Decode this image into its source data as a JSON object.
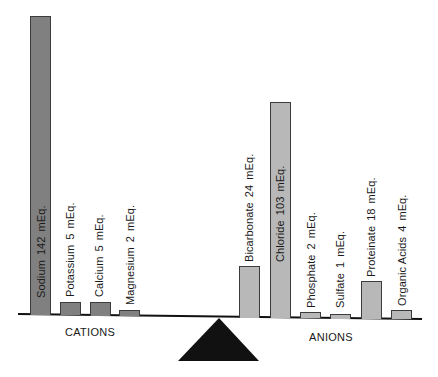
{
  "chart_data": {
    "type": "bar",
    "title": "",
    "subtitle": "",
    "xlabel": "",
    "ylabel": "",
    "grid": false,
    "legend": "none",
    "layout": "balance-scale: bars rest on a beam over a triangular fulcrum; cations on left, anions on right",
    "groups": [
      {
        "name": "CATIONS",
        "color": "#808080",
        "categories": [
          "Sodium",
          "Potassium",
          "Calcium",
          "Magnesium"
        ],
        "values": [
          142,
          5,
          5,
          2
        ],
        "unit": "mEq.",
        "labels": [
          "Sodium 142 mEq.",
          "Potassium 5 mEq.",
          "Calcium 5 mEq.",
          "Magnesium 2 mEq."
        ]
      },
      {
        "name": "ANIONS",
        "color": "#b8b8b8",
        "categories": [
          "Bicarbonate",
          "Chloride",
          "Phosphate",
          "Sulfate",
          "Proteinate",
          "Organic Acids"
        ],
        "values": [
          24,
          103,
          2,
          1,
          18,
          4
        ],
        "unit": "mEq.",
        "labels": [
          "Bicarbonate 24 mEq.",
          "Chloride 103 mEq.",
          "Phosphate 2 mEq.",
          "Sulfate 1 mEq.",
          "Proteinate 18 mEq.",
          "Organic Acids 4 mEq."
        ]
      }
    ],
    "totals": {
      "CATIONS": 154,
      "ANIONS": 152
    }
  },
  "labels": {
    "cations": "CATIONS",
    "anions": "ANIONS"
  },
  "colors": {
    "cation_bar": "#808080",
    "anion_bar": "#b8b8b8",
    "beam": "#111111",
    "fulcrum": "#111111"
  },
  "bars": [
    {
      "id": "sodium",
      "group": "cation",
      "name": "Sodium",
      "value": "142",
      "unit": "mEq.",
      "x": 30,
      "w": 21,
      "top": 16,
      "base": 315,
      "labelX": 35,
      "labelBottom": 298
    },
    {
      "id": "potassium",
      "group": "cation",
      "name": "Potassium",
      "value": "5",
      "unit": "mEq.",
      "x": 60,
      "w": 21,
      "top": 302,
      "base": 315,
      "labelX": 64,
      "labelBottom": 297
    },
    {
      "id": "calcium",
      "group": "cation",
      "name": "Calcium",
      "value": "5",
      "unit": "mEq.",
      "x": 90,
      "w": 21,
      "top": 302,
      "base": 316,
      "labelX": 93,
      "labelBottom": 297
    },
    {
      "id": "magnesium",
      "group": "cation",
      "name": "Magnesium",
      "value": "2",
      "unit": "mEq.",
      "x": 119,
      "w": 21,
      "top": 310,
      "base": 316,
      "labelX": 124,
      "labelBottom": 305
    },
    {
      "id": "bicarbonate",
      "group": "anion",
      "name": "Bicarbonate",
      "value": "24",
      "unit": "mEq.",
      "x": 239,
      "w": 21,
      "top": 266,
      "base": 318,
      "labelX": 243,
      "labelBottom": 262
    },
    {
      "id": "chloride",
      "group": "anion",
      "name": "Chloride",
      "value": "103",
      "unit": "mEq.",
      "x": 270,
      "w": 21,
      "top": 102,
      "base": 318,
      "labelX": 274,
      "labelBottom": 262
    },
    {
      "id": "phosphate",
      "group": "anion",
      "name": "Phosphate",
      "value": "2",
      "unit": "mEq.",
      "x": 300,
      "w": 21,
      "top": 312,
      "base": 318,
      "labelX": 305,
      "labelBottom": 308
    },
    {
      "id": "sulfate",
      "group": "anion",
      "name": "Sulfate",
      "value": "1",
      "unit": "mEq.",
      "x": 330,
      "w": 21,
      "top": 314,
      "base": 319,
      "labelX": 334,
      "labelBottom": 308
    },
    {
      "id": "proteinate",
      "group": "anion",
      "name": "Proteinate",
      "value": "18",
      "unit": "mEq.",
      "x": 361,
      "w": 21,
      "top": 281,
      "base": 319,
      "labelX": 365,
      "labelBottom": 277
    },
    {
      "id": "organic-acids",
      "group": "anion",
      "name": "Organic Acids",
      "value": "4",
      "unit": "mEq.",
      "x": 391,
      "w": 21,
      "top": 310,
      "base": 319,
      "labelX": 396,
      "labelBottom": 306
    }
  ]
}
